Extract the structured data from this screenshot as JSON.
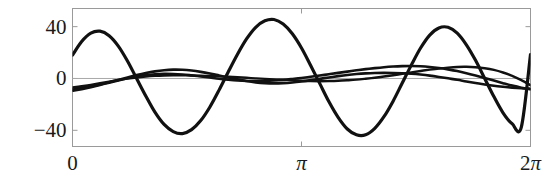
{
  "figure": {
    "title": "",
    "background": "#ffffff",
    "frame_color": "#9a9a9a",
    "curve_color": "#111111",
    "zero_line_color": "#a8a8a8"
  },
  "axes": {
    "y_ticks": [
      {
        "value": 40,
        "label": "40"
      },
      {
        "value": 0,
        "label": "0"
      },
      {
        "value": -40,
        "label": "−40"
      }
    ],
    "x_ticks": [
      {
        "value": 0,
        "label": "0",
        "pi_label": false,
        "coef": ""
      },
      {
        "value": 3.141593,
        "label": "π",
        "pi_label": true,
        "coef": ""
      },
      {
        "value": 6.283185,
        "label": "π",
        "pi_label": true,
        "coef": "2"
      }
    ],
    "xlim": [
      0,
      6.283185
    ],
    "ylim": [
      -52.5,
      54.0
    ],
    "xlabel": "",
    "ylabel": "",
    "grid": false,
    "legend": null
  },
  "chart_data": {
    "type": "line",
    "title": "",
    "xlabel": "",
    "ylabel": "",
    "xlim": [
      0,
      6.283185
    ],
    "ylim": [
      -52.5,
      54.0
    ],
    "grid": false,
    "legend_position": "none",
    "x_tick_labels": [
      "0",
      "π",
      "2π"
    ],
    "x_tick_values": [
      0,
      3.141593,
      6.283185
    ],
    "y_tick_labels": [
      "40",
      "0",
      "−40"
    ],
    "y_tick_values": [
      40,
      0,
      -40
    ],
    "series": [
      {
        "name": "large-amplitude-wave",
        "comment": "dominant oscillation, about 3 cycles across 0..2pi, amplitude ~45",
        "x": [
          0.0,
          0.1257,
          0.2513,
          0.377,
          0.5027,
          0.6283,
          0.754,
          0.8796,
          1.0053,
          1.131,
          1.2566,
          1.3823,
          1.508,
          1.6336,
          1.7593,
          1.885,
          2.0106,
          2.1363,
          2.2619,
          2.3876,
          2.5133,
          2.6389,
          2.7646,
          2.8903,
          3.0159,
          3.1416,
          3.2673,
          3.3929,
          3.5186,
          3.6442,
          3.7699,
          3.8956,
          4.0212,
          4.1469,
          4.2726,
          4.3982,
          4.5239,
          4.6496,
          4.7752,
          4.9009,
          5.0265,
          5.1522,
          5.2779,
          5.4035,
          5.5292,
          5.6549,
          5.7805,
          5.9062,
          6.0319,
          6.1575,
          6.2832
        ],
        "y": [
          18.0,
          28.5,
          35.0,
          36.5,
          33.0,
          25.0,
          13.5,
          0.0,
          -13.5,
          -26.0,
          -35.5,
          -41.0,
          -42.5,
          -39.5,
          -32.5,
          -22.0,
          -9.0,
          5.0,
          18.5,
          30.5,
          39.5,
          44.5,
          45.5,
          42.0,
          34.5,
          23.5,
          10.0,
          -4.0,
          -18.0,
          -30.0,
          -39.0,
          -43.5,
          -43.5,
          -38.5,
          -29.5,
          -17.5,
          -3.5,
          10.5,
          23.5,
          33.5,
          39.0,
          39.5,
          35.0,
          26.0,
          14.0,
          0.0,
          -14.0,
          -26.5,
          -35.0,
          -37.5,
          18.5
        ]
      },
      {
        "name": "medium-small-wave-a",
        "comment": "low amplitude ~10, about 2.5 cycles, starts near -8",
        "x": [
          0.0,
          0.1257,
          0.2513,
          0.377,
          0.5027,
          0.6283,
          0.754,
          0.8796,
          1.0053,
          1.131,
          1.2566,
          1.3823,
          1.508,
          1.6336,
          1.7593,
          1.885,
          2.0106,
          2.1363,
          2.2619,
          2.3876,
          2.5133,
          2.6389,
          2.7646,
          2.8903,
          3.0159,
          3.1416,
          3.2673,
          3.3929,
          3.5186,
          3.6442,
          3.7699,
          3.8956,
          4.0212,
          4.1469,
          4.2726,
          4.3982,
          4.5239,
          4.6496,
          4.7752,
          4.9009,
          5.0265,
          5.1522,
          5.2779,
          5.4035,
          5.5292,
          5.6549,
          5.7805,
          5.9062,
          6.0319,
          6.1575,
          6.2832
        ],
        "y": [
          -8.5,
          -7.4,
          -6.1,
          -4.6,
          -2.9,
          -1.1,
          0.8,
          2.6,
          4.2,
          5.5,
          6.4,
          6.8,
          6.7,
          6.1,
          5.1,
          3.8,
          2.3,
          0.8,
          -0.7,
          -2.0,
          -3.0,
          -3.6,
          -3.8,
          -3.6,
          -3.1,
          -2.3,
          -1.3,
          -0.3,
          0.8,
          1.8,
          2.7,
          3.4,
          3.9,
          4.2,
          4.3,
          4.2,
          4.0,
          3.6,
          3.0,
          2.2,
          1.2,
          0.1,
          -1.0,
          -2.3,
          -3.5,
          -4.6,
          -5.6,
          -6.4,
          -7.1,
          -7.6,
          -7.9
        ]
      },
      {
        "name": "medium-small-wave-b",
        "comment": "low amplitude ~11, about 1.5 cycles, crosses wave-a several times",
        "x": [
          0.0,
          0.1257,
          0.2513,
          0.377,
          0.5027,
          0.6283,
          0.754,
          0.8796,
          1.0053,
          1.131,
          1.2566,
          1.3823,
          1.508,
          1.6336,
          1.7593,
          1.885,
          2.0106,
          2.1363,
          2.2619,
          2.3876,
          2.5133,
          2.6389,
          2.7646,
          2.8903,
          3.0159,
          3.1416,
          3.2673,
          3.3929,
          3.5186,
          3.6442,
          3.7699,
          3.8956,
          4.0212,
          4.1469,
          4.2726,
          4.3982,
          4.5239,
          4.6496,
          4.7752,
          4.9009,
          5.0265,
          5.1522,
          5.2779,
          5.4035,
          5.5292,
          5.6549,
          5.7805,
          5.9062,
          6.0319,
          6.1575,
          6.2832
        ],
        "y": [
          -9.5,
          -8.2,
          -6.7,
          -5.0,
          -3.2,
          -1.5,
          0.1,
          1.5,
          2.6,
          3.3,
          3.6,
          3.5,
          3.1,
          2.4,
          1.6,
          0.7,
          -0.2,
          -0.9,
          -1.5,
          -1.9,
          -2.0,
          -1.9,
          -1.6,
          -1.1,
          -0.4,
          0.4,
          1.3,
          2.3,
          3.3,
          4.3,
          5.3,
          6.3,
          7.2,
          8.0,
          8.7,
          9.2,
          9.5,
          9.6,
          9.4,
          8.9,
          8.1,
          7.0,
          5.7,
          4.1,
          2.3,
          0.4,
          -1.6,
          -3.6,
          -5.5,
          -7.1,
          -8.4
        ]
      },
      {
        "name": "small-wave-c",
        "comment": "lowest amplitude ~8, broad single-hump shape riding near zero",
        "x": [
          0.0,
          0.1257,
          0.2513,
          0.377,
          0.5027,
          0.6283,
          0.754,
          0.8796,
          1.0053,
          1.131,
          1.2566,
          1.3823,
          1.508,
          1.6336,
          1.7593,
          1.885,
          2.0106,
          2.1363,
          2.2619,
          2.3876,
          2.5133,
          2.6389,
          2.7646,
          2.8903,
          3.0159,
          3.1416,
          3.2673,
          3.3929,
          3.5186,
          3.6442,
          3.7699,
          3.8956,
          4.0212,
          4.1469,
          4.2726,
          4.3982,
          4.5239,
          4.6496,
          4.7752,
          4.9009,
          5.0265,
          5.1522,
          5.2779,
          5.4035,
          5.5292,
          5.6549,
          5.7805,
          5.9062,
          6.0319,
          6.1575,
          6.2832
        ],
        "y": [
          -7.0,
          -6.0,
          -4.9,
          -3.7,
          -2.4,
          -1.2,
          -0.1,
          0.8,
          1.5,
          2.0,
          2.3,
          2.4,
          2.4,
          2.3,
          2.1,
          1.9,
          1.6,
          1.3,
          0.9,
          0.5,
          0.1,
          -0.3,
          -0.7,
          -1.1,
          -1.5,
          -1.8,
          -2.0,
          -2.1,
          -2.0,
          -1.8,
          -1.4,
          -0.9,
          -0.2,
          0.6,
          1.5,
          2.5,
          3.6,
          4.7,
          5.8,
          6.8,
          7.7,
          8.4,
          8.9,
          9.0,
          8.7,
          7.9,
          6.6,
          4.6,
          2.0,
          -1.3,
          -5.2
        ]
      }
    ]
  }
}
